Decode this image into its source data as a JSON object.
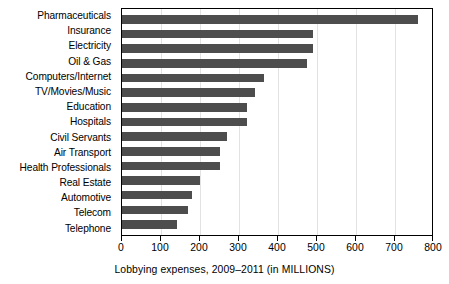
{
  "chart_data": {
    "type": "bar",
    "orientation": "horizontal",
    "title": "",
    "xlabel": "Lobbying expenses, 2009–2011 (in MILLIONS)",
    "ylabel": "",
    "xlim": [
      0,
      800
    ],
    "xticks": [
      0,
      100,
      200,
      300,
      400,
      500,
      600,
      700,
      800
    ],
    "grid": true,
    "legend": null,
    "bar_color": "#4d4d4d",
    "categories": [
      "Pharmaceuticals",
      "Insurance",
      "Electricity",
      "Oil & Gas",
      "Computers/Internet",
      "TV/Movies/Music",
      "Education",
      "Hospitals",
      "Civil Servants",
      "Air Transport",
      "Health Professionals",
      "Real Estate",
      "Automotive",
      "Telecom",
      "Telephone"
    ],
    "values": [
      760,
      490,
      490,
      475,
      365,
      342,
      320,
      320,
      270,
      250,
      252,
      200,
      180,
      170,
      142
    ]
  }
}
